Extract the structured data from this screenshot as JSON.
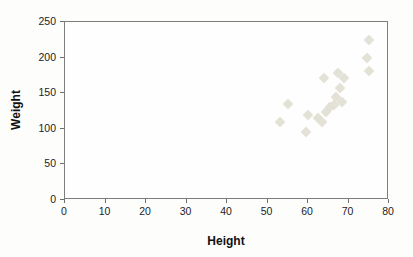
{
  "chart_data": {
    "type": "scatter",
    "title": "",
    "xlabel": "Height",
    "ylabel": "Weight",
    "xlim": [
      0,
      80
    ],
    "ylim": [
      0,
      250
    ],
    "x_ticks": [
      0,
      10,
      20,
      30,
      40,
      50,
      60,
      70,
      80
    ],
    "y_ticks": [
      0,
      50,
      100,
      150,
      200,
      250
    ],
    "grid": false,
    "legend": "none",
    "marker_shape": "diamond",
    "marker_color": "#e4e1d6",
    "frame_color": "#7d7d7d",
    "points": [
      {
        "x": 53,
        "y": 110
      },
      {
        "x": 55,
        "y": 135
      },
      {
        "x": 59.5,
        "y": 96
      },
      {
        "x": 60,
        "y": 120
      },
      {
        "x": 62.5,
        "y": 115
      },
      {
        "x": 63.5,
        "y": 109
      },
      {
        "x": 64,
        "y": 172
      },
      {
        "x": 64.5,
        "y": 123
      },
      {
        "x": 65.5,
        "y": 130
      },
      {
        "x": 66.5,
        "y": 134
      },
      {
        "x": 67,
        "y": 144
      },
      {
        "x": 67.5,
        "y": 179
      },
      {
        "x": 68,
        "y": 157
      },
      {
        "x": 68.5,
        "y": 138
      },
      {
        "x": 69,
        "y": 171
      },
      {
        "x": 74.5,
        "y": 199
      },
      {
        "x": 75,
        "y": 225
      },
      {
        "x": 75,
        "y": 181
      }
    ]
  },
  "layout_px": {
    "plot_left": 64,
    "plot_top": 21,
    "plot_width": 324,
    "plot_height": 178
  }
}
